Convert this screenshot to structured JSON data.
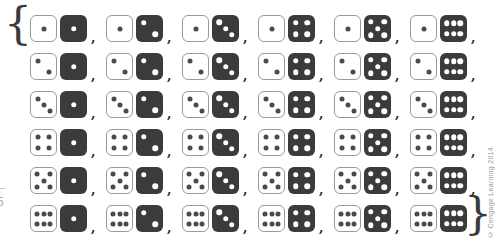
{
  "figure": {
    "open_brace": "{",
    "close_brace": "}",
    "separator": ",",
    "copyright": "© Cengage Learning 2014",
    "left_margin_text": "5"
  },
  "dice": {
    "colors": {
      "white_die_bg": "#ffffff",
      "white_die_border": "#9a9a9a",
      "white_die_pip": "#4a4a4a",
      "dark_die_bg": "#3b3b3b",
      "dark_die_pip": "#ffffff"
    },
    "rows": [
      {
        "white": 1,
        "dark": [
          1,
          2,
          3,
          4,
          5,
          6
        ]
      },
      {
        "white": 2,
        "dark": [
          1,
          2,
          3,
          4,
          5,
          6
        ]
      },
      {
        "white": 3,
        "dark": [
          1,
          2,
          3,
          4,
          5,
          6
        ]
      },
      {
        "white": 4,
        "dark": [
          1,
          2,
          3,
          4,
          5,
          6
        ]
      },
      {
        "white": 5,
        "dark": [
          1,
          2,
          3,
          4,
          5,
          6
        ]
      },
      {
        "white": 6,
        "dark": [
          1,
          2,
          3,
          4,
          5,
          6
        ]
      }
    ]
  }
}
